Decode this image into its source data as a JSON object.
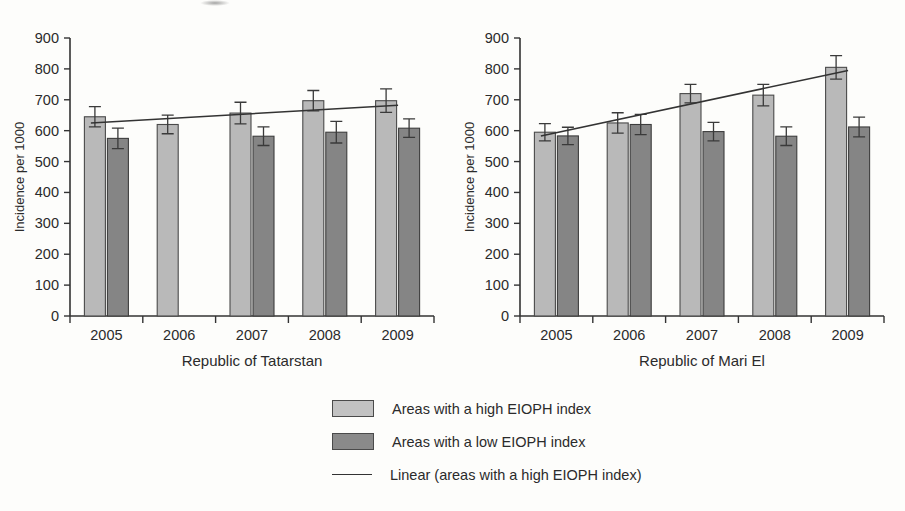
{
  "chart_data": [
    {
      "type": "bar",
      "title": "",
      "xlabel": "Republic of Tatarstan",
      "ylabel": "Incidence per 1000",
      "categories": [
        "2005",
        "2006",
        "2007",
        "2008",
        "2009"
      ],
      "ylim": [
        0,
        900
      ],
      "ytick_step": 100,
      "yticks": [
        "0",
        "100",
        "200",
        "300",
        "400",
        "500",
        "600",
        "700",
        "800",
        "900"
      ],
      "grid": false,
      "legend_position": "below-figure",
      "series": [
        {
          "name": "Areas with a high EIOPH index",
          "color": "#b9b9b9",
          "values": [
            645,
            620,
            657,
            697,
            697
          ],
          "errors": [
            33,
            30,
            35,
            33,
            38
          ]
        },
        {
          "name": "Areas with a low EIOPH index",
          "color": "#858585",
          "values": [
            575,
            null,
            582,
            595,
            608
          ],
          "errors": [
            33,
            null,
            30,
            35,
            30
          ]
        }
      ],
      "trend": {
        "name": "Linear (areas with a high EIOPH index)",
        "start_value": 625,
        "end_value": 682
      }
    },
    {
      "type": "bar",
      "title": "",
      "xlabel": "Republic of Mari El",
      "ylabel": "Incidence per 1000",
      "categories": [
        "2005",
        "2006",
        "2007",
        "2008",
        "2009"
      ],
      "ylim": [
        0,
        900
      ],
      "ytick_step": 100,
      "yticks": [
        "0",
        "100",
        "200",
        "300",
        "400",
        "500",
        "600",
        "700",
        "800",
        "900"
      ],
      "grid": false,
      "legend_position": "below-figure",
      "series": [
        {
          "name": "Areas with a high EIOPH index",
          "color": "#b9b9b9",
          "values": [
            595,
            625,
            720,
            715,
            805
          ],
          "errors": [
            28,
            33,
            30,
            35,
            38
          ]
        },
        {
          "name": "Areas with a low EIOPH index",
          "color": "#858585",
          "values": [
            583,
            620,
            597,
            582,
            612
          ],
          "errors": [
            28,
            33,
            30,
            30,
            32
          ]
        }
      ],
      "trend": {
        "name": "Linear (areas with a high EIOPH index)",
        "start_value": 583,
        "end_value": 795
      }
    }
  ],
  "legend": {
    "items": [
      {
        "marker": "swatch-high",
        "label": "Areas with a high EIOPH index"
      },
      {
        "marker": "swatch-low",
        "label": "Areas with a low EIOPH index"
      },
      {
        "marker": "line",
        "label": "Linear (areas with a high EIOPH index)"
      }
    ]
  }
}
